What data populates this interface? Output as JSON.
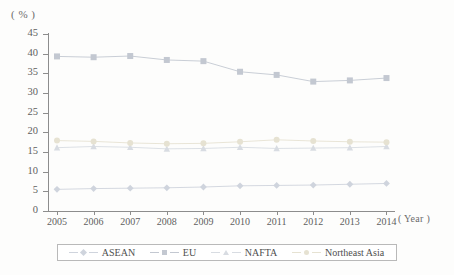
{
  "chart_data": {
    "type": "line",
    "title": "",
    "subtitle": "",
    "xlabel": "( Year )",
    "ylabel": "( % )",
    "x": [
      2005,
      2006,
      2007,
      2008,
      2009,
      2010,
      2011,
      2012,
      2013,
      2014
    ],
    "categories": [
      "2005",
      "2006",
      "2007",
      "2008",
      "2009",
      "2010",
      "2011",
      "2012",
      "2013",
      "2014"
    ],
    "xlim": [
      2005,
      2014
    ],
    "ylim": [
      0,
      45
    ],
    "ytick_values": [
      0,
      5,
      10,
      15,
      20,
      25,
      30,
      35,
      40,
      45
    ],
    "ytick_labels": [
      "0",
      "5",
      "10",
      "15",
      "20",
      "25",
      "30",
      "35",
      "40",
      "45"
    ],
    "grid": false,
    "legend_position": "bottom",
    "series": [
      {
        "name": "ASEAN",
        "marker": "diamond",
        "color": "#cfd4dd",
        "values": [
          5.5,
          5.7,
          5.8,
          5.9,
          6.1,
          6.4,
          6.5,
          6.6,
          6.8,
          7.0
        ]
      },
      {
        "name": "EU",
        "marker": "square",
        "color": "#c3c8d1",
        "values": [
          39.3,
          39.1,
          39.4,
          38.4,
          38.1,
          35.4,
          34.6,
          32.9,
          33.2,
          33.8
        ]
      },
      {
        "name": "NAFTA",
        "marker": "triangle",
        "color": "#d8dce2",
        "values": [
          16.1,
          16.4,
          16.2,
          15.8,
          15.9,
          16.2,
          15.9,
          16.0,
          16.1,
          16.4
        ]
      },
      {
        "name": "Northeast Asia",
        "marker": "circle",
        "color": "#e6e2d2",
        "values": [
          17.9,
          17.7,
          17.3,
          17.1,
          17.2,
          17.6,
          18.1,
          17.8,
          17.6,
          17.5
        ]
      }
    ]
  },
  "legend": {
    "items": [
      {
        "label": "ASEAN"
      },
      {
        "label": "EU"
      },
      {
        "label": "NAFTA"
      },
      {
        "label": "Northeast Asia"
      }
    ]
  }
}
